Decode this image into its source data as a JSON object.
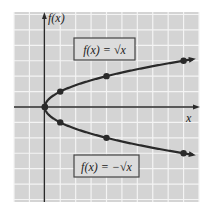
{
  "chart_data": {
    "type": "line",
    "title": "",
    "xlabel": "x",
    "ylabel": "f(x)",
    "xlim": [
      -2,
      10
    ],
    "ylim": [
      -6,
      6
    ],
    "grid": true,
    "legend": "none",
    "series": [
      {
        "name": "f(x) = √x",
        "x": [
          0,
          1,
          4,
          9
        ],
        "y": [
          0,
          1,
          2,
          3
        ]
      },
      {
        "name": "f(x) = −√x",
        "x": [
          0,
          1,
          4,
          9
        ],
        "y": [
          0,
          -1,
          -2,
          -3
        ]
      }
    ],
    "annotations": [
      {
        "text": "f(x) = √x",
        "position": "upper-middle"
      },
      {
        "text": "f(x) = −√x",
        "position": "lower-middle"
      }
    ]
  },
  "labels": {
    "y_axis": "f(x)",
    "x_axis": "x",
    "top_box": "f(x) = √x",
    "bottom_box": "f(x) = −√x"
  },
  "colors": {
    "grid_bg": "#d4d4d4",
    "grid_line": "#f4f4f4",
    "axis": "#2a2a2a",
    "curve": "#2a2a2a"
  }
}
